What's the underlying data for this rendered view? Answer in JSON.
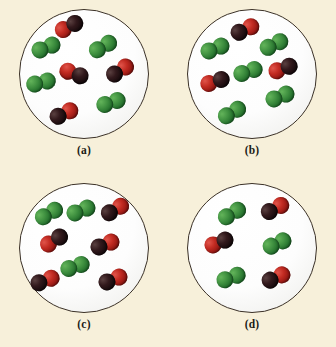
{
  "figure": {
    "background_color": "#f7f0da",
    "vessel_fill_color": "#ffffff",
    "vessel_border_color": "#3b3127",
    "atom_colors": {
      "green": "#3f9040",
      "black": "#32191c",
      "red": "#c22b22"
    },
    "legend_note": "Green diatomic molecules and black-red diatomic molecules shown at the molecular level inside four round reaction vessels."
  },
  "chart_data": {
    "type": "diagram",
    "title": "",
    "xlabel": "",
    "ylabel": "",
    "categories": [
      "(a)",
      "(b)",
      "(c)",
      "(d)"
    ],
    "series": [
      {
        "name": "green-green molecules",
        "values": [
          4,
          6,
          3,
          3
        ]
      },
      {
        "name": "black-red molecules",
        "values": [
          4,
          3,
          6,
          3
        ]
      }
    ],
    "legend_position": "none",
    "grid": false
  },
  "panels": [
    {
      "label": "(a)",
      "name": "panel-a",
      "counts": {
        "green": 4,
        "black_red": 4
      },
      "molecules": [
        {
          "type": "black-red",
          "x": 50,
          "y": 17,
          "rotate": -28,
          "flip": false
        },
        {
          "type": "green-green",
          "x": 27,
          "y": 38,
          "rotate": -22,
          "flip": false
        },
        {
          "type": "green-green",
          "x": 84,
          "y": 37,
          "rotate": -30,
          "flip": false
        },
        {
          "type": "black-red",
          "x": 55,
          "y": 64,
          "rotate": 20,
          "flip": false
        },
        {
          "type": "black-red",
          "x": 101,
          "y": 61,
          "rotate": -32,
          "flip": true
        },
        {
          "type": "green-green",
          "x": 22,
          "y": 73,
          "rotate": -14,
          "flip": false
        },
        {
          "type": "green-green",
          "x": 92,
          "y": 93,
          "rotate": -18,
          "flip": false
        },
        {
          "type": "black-red",
          "x": 45,
          "y": 104,
          "rotate": -25,
          "flip": true
        }
      ]
    },
    {
      "label": "(b)",
      "name": "panel-b",
      "counts": {
        "green": 6,
        "black_red": 3
      },
      "molecules": [
        {
          "type": "black-red",
          "x": 58,
          "y": 20,
          "rotate": -25,
          "flip": true
        },
        {
          "type": "green-green",
          "x": 28,
          "y": 39,
          "rotate": -22,
          "flip": false
        },
        {
          "type": "green-green",
          "x": 87,
          "y": 35,
          "rotate": -26,
          "flip": false
        },
        {
          "type": "green-green",
          "x": 61,
          "y": 62,
          "rotate": -18,
          "flip": false
        },
        {
          "type": "black-red",
          "x": 96,
          "y": 59,
          "rotate": -20,
          "flip": false
        },
        {
          "type": "black-red",
          "x": 28,
          "y": 72,
          "rotate": -18,
          "flip": false
        },
        {
          "type": "green-green",
          "x": 93,
          "y": 87,
          "rotate": -22,
          "flip": false
        },
        {
          "type": "green-green",
          "x": 45,
          "y": 103,
          "rotate": -30,
          "flip": false
        }
      ]
    },
    {
      "label": "(c)",
      "name": "panel-c",
      "counts": {
        "green": 3,
        "black_red": 6
      },
      "molecules": [
        {
          "type": "green-green",
          "x": 30,
          "y": 31,
          "rotate": -30,
          "flip": false
        },
        {
          "type": "green-green",
          "x": 62,
          "y": 28,
          "rotate": -22,
          "flip": false
        },
        {
          "type": "black-red",
          "x": 96,
          "y": 27,
          "rotate": -30,
          "flip": true
        },
        {
          "type": "black-red",
          "x": 35,
          "y": 58,
          "rotate": -32,
          "flip": false
        },
        {
          "type": "black-red",
          "x": 86,
          "y": 62,
          "rotate": -22,
          "flip": true
        },
        {
          "type": "green-green",
          "x": 56,
          "y": 84,
          "rotate": -18,
          "flip": false
        },
        {
          "type": "black-red",
          "x": 26,
          "y": 98,
          "rotate": -20,
          "flip": true
        },
        {
          "type": "black-red",
          "x": 94,
          "y": 97,
          "rotate": -22,
          "flip": true
        }
      ]
    },
    {
      "label": "(d)",
      "name": "panel-d",
      "counts": {
        "green": 3,
        "black_red": 3
      },
      "molecules": [
        {
          "type": "green-green",
          "x": 45,
          "y": 31,
          "rotate": -30,
          "flip": false
        },
        {
          "type": "black-red",
          "x": 88,
          "y": 26,
          "rotate": -28,
          "flip": true
        },
        {
          "type": "black-red",
          "x": 32,
          "y": 60,
          "rotate": -22,
          "flip": false
        },
        {
          "type": "green-green",
          "x": 90,
          "y": 61,
          "rotate": -24,
          "flip": false
        },
        {
          "type": "green-green",
          "x": 44,
          "y": 95,
          "rotate": -20,
          "flip": false
        },
        {
          "type": "black-red",
          "x": 89,
          "y": 95,
          "rotate": -24,
          "flip": true
        }
      ]
    }
  ]
}
